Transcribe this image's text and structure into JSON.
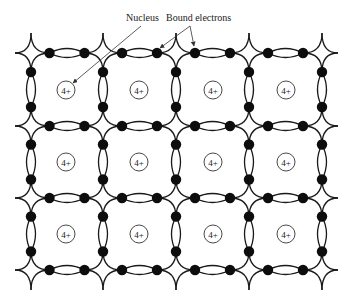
{
  "diagram": {
    "labels": {
      "nucleus": "Nucleus",
      "bound_electrons": "Bound electrons"
    },
    "ion_charge": "4+",
    "grid": {
      "columns_x": [
        31,
        103,
        176,
        249,
        322
      ],
      "rows_y": [
        53,
        126,
        198,
        270
      ],
      "cell_centers_x": [
        66,
        139,
        213,
        286
      ],
      "cell_centers_y": [
        90,
        162,
        234
      ],
      "ion_radius": 9,
      "electron_radius": 5.2,
      "electron_offset": 17.5
    },
    "colors": {
      "line": "#1a1a1a",
      "electron": "#0d0d0d",
      "background": "#ffffff"
    },
    "annotations": {
      "nucleus_label_pos": [
        126,
        21
      ],
      "bound_label_pos": [
        166,
        21
      ],
      "nucleus_arrow": {
        "from": [
          141,
          26
        ],
        "to": [
          73,
          83
        ]
      },
      "bound_arrows": [
        {
          "from": [
            190,
            26
          ],
          "to": [
            160,
            48
          ]
        },
        {
          "from": [
            190,
            26
          ],
          "to": [
            194,
            46
          ]
        }
      ]
    }
  }
}
